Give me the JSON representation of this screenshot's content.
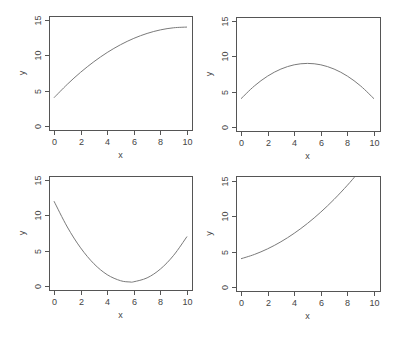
{
  "chart_data": [
    {
      "type": "line",
      "panel": "top-left",
      "title": "",
      "xlabel": "x",
      "ylabel": "y",
      "xlim": [
        0,
        10
      ],
      "ylim": [
        0,
        15
      ],
      "xticks": [
        0,
        2,
        4,
        6,
        8,
        10
      ],
      "yticks": [
        0,
        5,
        10,
        15
      ],
      "grid": false,
      "x": [
        0,
        1,
        2,
        3,
        4,
        5,
        6,
        7,
        8,
        9,
        10
      ],
      "y": [
        4,
        5.9,
        7.6,
        9.1,
        10.4,
        11.5,
        12.4,
        13.1,
        13.6,
        13.9,
        14
      ],
      "formula_hint": "y = 4 + 2x - 0.1x^2"
    },
    {
      "type": "line",
      "panel": "top-right",
      "title": "",
      "xlabel": "x",
      "ylabel": "y",
      "xlim": [
        0,
        10
      ],
      "ylim": [
        0,
        15
      ],
      "xticks": [
        0,
        2,
        4,
        6,
        8,
        10
      ],
      "yticks": [
        0,
        5,
        10,
        15
      ],
      "grid": false,
      "x": [
        0,
        1,
        2,
        3,
        4,
        5,
        6,
        7,
        8,
        9,
        10
      ],
      "y": [
        4,
        5.8,
        7.2,
        8.2,
        8.8,
        9,
        8.8,
        8.2,
        7.2,
        5.8,
        4
      ],
      "formula_hint": "y = 4 + 2x - 0.2x^2"
    },
    {
      "type": "line",
      "panel": "bottom-left",
      "title": "",
      "xlabel": "x",
      "ylabel": "y",
      "xlim": [
        0,
        10
      ],
      "ylim": [
        0,
        15
      ],
      "xticks": [
        0,
        2,
        4,
        6,
        8,
        10
      ],
      "yticks": [
        0,
        5,
        10,
        15
      ],
      "grid": false,
      "x": [
        0,
        1,
        2,
        3,
        4,
        5,
        5.71,
        6,
        7,
        8,
        9,
        10
      ],
      "y": [
        12,
        8.35,
        5.4,
        3.15,
        1.6,
        0.75,
        0.57,
        0.6,
        1.15,
        2.4,
        4.35,
        7
      ],
      "formula_hint": "y = 12 - 4x + 0.35x^2"
    },
    {
      "type": "line",
      "panel": "bottom-right",
      "title": "",
      "xlabel": "x",
      "ylabel": "y",
      "xlim": [
        0,
        10
      ],
      "ylim": [
        0,
        15
      ],
      "xticks": [
        0,
        2,
        4,
        6,
        8,
        10
      ],
      "yticks": [
        0,
        5,
        10,
        15
      ],
      "grid": false,
      "x": [
        0,
        1,
        2,
        3,
        4,
        5,
        6,
        7,
        8,
        8.6
      ],
      "y": [
        4,
        4.6,
        5.4,
        6.4,
        7.6,
        9,
        10.6,
        12.4,
        14.4,
        15.7
      ],
      "formula_hint": "y = 4 + 0.5x + 0.1x^2 (clipped at top of plot)"
    }
  ],
  "panels": [
    {
      "xlabel": "x",
      "ylabel": "y",
      "xtick_labels": [
        "0",
        "2",
        "4",
        "6",
        "8",
        "10"
      ],
      "ytick_labels": [
        "0",
        "5",
        "10",
        "15"
      ]
    },
    {
      "xlabel": "x",
      "ylabel": "y",
      "xtick_labels": [
        "0",
        "2",
        "4",
        "6",
        "8",
        "10"
      ],
      "ytick_labels": [
        "0",
        "5",
        "10",
        "15"
      ]
    },
    {
      "xlabel": "x",
      "ylabel": "y",
      "xtick_labels": [
        "0",
        "2",
        "4",
        "6",
        "8",
        "10"
      ],
      "ytick_labels": [
        "0",
        "5",
        "10",
        "15"
      ]
    },
    {
      "xlabel": "x",
      "ylabel": "y",
      "xtick_labels": [
        "0",
        "2",
        "4",
        "6",
        "8",
        "10"
      ],
      "ytick_labels": [
        "0",
        "5",
        "10",
        "15"
      ]
    }
  ],
  "colors": {
    "line": "#7a7a7a",
    "axis": "#555555",
    "text": "#444444",
    "background": "#ffffff"
  }
}
